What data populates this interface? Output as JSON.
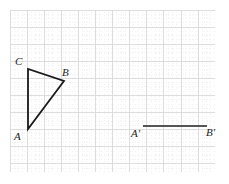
{
  "figure": {
    "background_color": "#ffffff",
    "width": 229,
    "height": 184
  },
  "grid": {
    "enabled": true,
    "origin_x": 10,
    "origin_y": 10,
    "right": 215,
    "bottom": 172,
    "major_spacing": 17.1,
    "minor_per_major": 4,
    "major_color": "#d9d9d9",
    "minor_color": "#ebebeb",
    "major_cols": 12,
    "major_rows": 9.5
  },
  "labels": {
    "C": "C",
    "B": "B",
    "A": "A",
    "A_prime": "A'",
    "B_prime": "B'"
  },
  "stroke": {
    "shape_color": "#1a1a1a",
    "shape_width": 1.8,
    "segment_color": "#555555",
    "segment_width": 1.9
  },
  "chart_data": {
    "type": "scatter",
    "xlabel": "",
    "ylabel": "",
    "grid": true,
    "legend_position": "none",
    "xlim": [
      10,
      215
    ],
    "ylim": [
      172,
      10
    ],
    "shapes": [
      {
        "name": "triangle-ABC",
        "kind": "polygon",
        "closed": true,
        "stroke": "#1a1a1a",
        "points": [
          {
            "label": "A",
            "x": 28,
            "y": 129
          },
          {
            "label": "C",
            "x": 28,
            "y": 69
          },
          {
            "label": "B",
            "x": 64,
            "y": 81
          }
        ]
      },
      {
        "name": "segment-A-prime-B-prime",
        "kind": "line",
        "closed": false,
        "stroke": "#555555",
        "points": [
          {
            "label": "A'",
            "x": 143,
            "y": 126
          },
          {
            "label": "B'",
            "x": 207,
            "y": 126
          }
        ]
      }
    ],
    "annotations": [
      {
        "text": "C",
        "x": 20,
        "y": 62
      },
      {
        "text": "B",
        "x": 67,
        "y": 73
      },
      {
        "text": "A",
        "x": 19,
        "y": 137
      },
      {
        "text": "A'",
        "x": 136,
        "y": 134
      },
      {
        "text": "B'",
        "x": 211,
        "y": 133
      }
    ]
  }
}
